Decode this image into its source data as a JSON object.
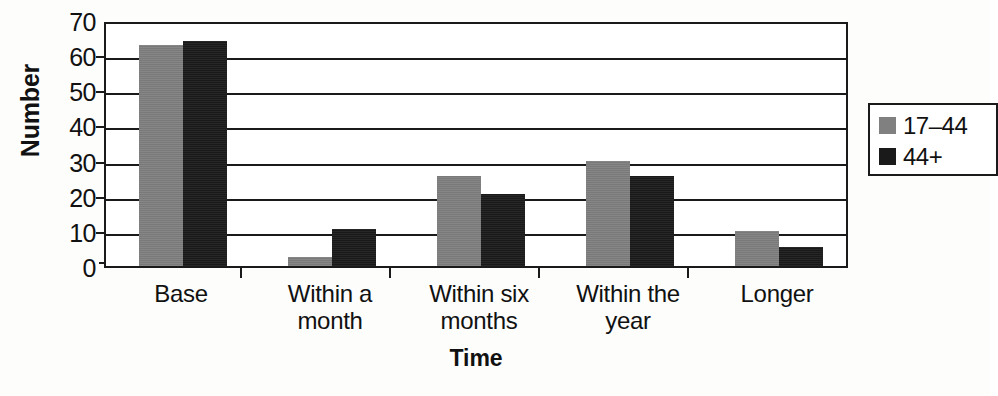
{
  "chart_data": {
    "type": "bar",
    "title": "",
    "xlabel": "Time",
    "ylabel": "Number",
    "categories": [
      "Base",
      "Within a\nmonth",
      "Within six\nmonths",
      "Within the\nyear",
      "Longer"
    ],
    "series": [
      {
        "name": "17–44",
        "color": "#808080",
        "values": [
          63,
          2.5,
          25.5,
          30,
          10
        ]
      },
      {
        "name": "44+",
        "color": "#1a1a1a",
        "values": [
          64,
          10.5,
          20.5,
          25.5,
          5.5
        ]
      }
    ],
    "ylim": [
      0,
      70
    ],
    "yticks": [
      0,
      10,
      20,
      30,
      40,
      50,
      60,
      70
    ],
    "ytick_labels": [
      "0",
      "10",
      "20",
      "30",
      "40",
      "50",
      "60",
      "70"
    ],
    "grid": "horizontal",
    "legend_position": "right",
    "legend_entries": [
      "17–44",
      "44+"
    ],
    "bar_layout": {
      "group_starts_px": [
        33,
        182,
        331,
        480,
        629
      ],
      "bar_width_px": 44,
      "group_separator_px": [
        136,
        285,
        434,
        583
      ],
      "plot_height_px": 246,
      "plot_width_px": 744,
      "value_max": 70
    }
  }
}
